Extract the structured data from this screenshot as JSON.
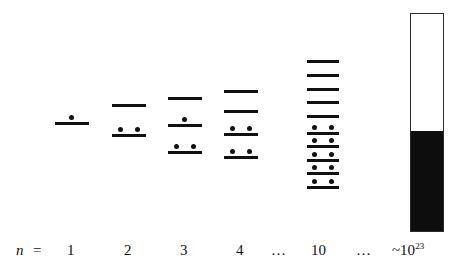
{
  "figure": {
    "axis_row": {
      "symbol": "n",
      "equals": "=",
      "labels": [
        "1",
        "2",
        "3",
        "4",
        "…",
        "10",
        "…"
      ],
      "bulk_label_base": "~10",
      "bulk_label_exponent": "23"
    },
    "colors": {
      "level": "#111111",
      "electron": "#111111",
      "box_border": "#2b2b2b",
      "box_fill": "#0d0d0d",
      "background": "#ffffff"
    }
  },
  "chart_data": {
    "type": "diagram",
    "xlabel": "n =",
    "ylabel": "Energy",
    "grid": false,
    "legend": false,
    "columns": [
      {
        "n": "1",
        "label": "1",
        "level_count": 1,
        "electron_count": 1,
        "levels": [
          {
            "index": 0,
            "electrons": 1
          }
        ]
      },
      {
        "n": "2",
        "label": "2",
        "level_count": 2,
        "electron_count": 2,
        "levels": [
          {
            "index": 0,
            "electrons": 0
          },
          {
            "index": 1,
            "electrons": 2
          }
        ]
      },
      {
        "n": "3",
        "label": "3",
        "level_count": 3,
        "electron_count": 3,
        "levels": [
          {
            "index": 0,
            "electrons": 0
          },
          {
            "index": 1,
            "electrons": 1
          },
          {
            "index": 2,
            "electrons": 2
          }
        ]
      },
      {
        "n": "4",
        "label": "4",
        "level_count": 4,
        "electron_count": 4,
        "levels": [
          {
            "index": 0,
            "electrons": 0
          },
          {
            "index": 1,
            "electrons": 0
          },
          {
            "index": 2,
            "electrons": 2
          },
          {
            "index": 3,
            "electrons": 2
          }
        ]
      },
      {
        "n": "ellipsis-1",
        "label": "…",
        "level_count": 0,
        "electron_count": 0,
        "levels": []
      },
      {
        "n": "10",
        "label": "10",
        "level_count": 10,
        "electron_count": 10,
        "levels": [
          {
            "index": 0,
            "electrons": 0
          },
          {
            "index": 1,
            "electrons": 0
          },
          {
            "index": 2,
            "electrons": 0
          },
          {
            "index": 3,
            "electrons": 0
          },
          {
            "index": 4,
            "electrons": 0
          },
          {
            "index": 5,
            "electrons": 2
          },
          {
            "index": 6,
            "electrons": 2
          },
          {
            "index": 7,
            "electrons": 2
          },
          {
            "index": 8,
            "electrons": 2
          },
          {
            "index": 9,
            "electrons": 2
          }
        ]
      },
      {
        "n": "ellipsis-2",
        "label": "…",
        "level_count": 0,
        "electron_count": 0,
        "levels": []
      },
      {
        "n": "~10^23",
        "label": "~10",
        "label_exponent": "23",
        "level_count": "continuum",
        "band": {
          "filled_fraction": 0.46,
          "empty_fraction": 0.54
        }
      }
    ]
  }
}
